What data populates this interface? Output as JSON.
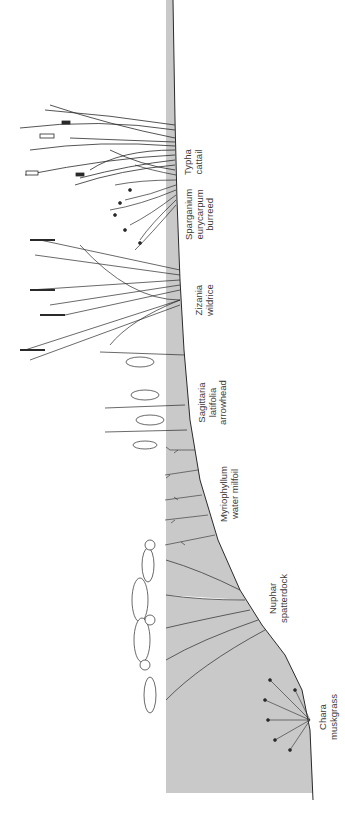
{
  "diagram": {
    "orientation": "rotated 90 degrees; shore at top, deep water at bottom",
    "colors": {
      "water": "#c9c9c9",
      "ink": "#2a2a2a",
      "background": "#ffffff",
      "label": "#3a3a3a"
    },
    "zones": [
      {
        "id": "typha",
        "genus": "Typha",
        "common": "cattail"
      },
      {
        "id": "sparganium",
        "genus": "Sparganium",
        "species": "eurycarpum",
        "common": "burreed"
      },
      {
        "id": "zizania",
        "genus": "Zizania",
        "common": "wildrice"
      },
      {
        "id": "sagittaria",
        "genus": "Sagittaria",
        "species": "latifolia",
        "common": "arrowhead"
      },
      {
        "id": "myriophyllum",
        "genus": "Myriophyllum",
        "common": "water milfoil"
      },
      {
        "id": "nuphar",
        "genus": "Nuphar",
        "common": "spatterdock"
      },
      {
        "id": "chara",
        "genus": "Chara",
        "common": "muskgrass"
      }
    ]
  }
}
